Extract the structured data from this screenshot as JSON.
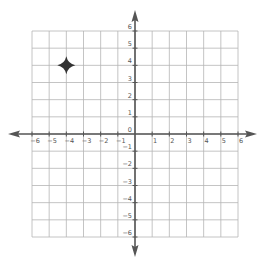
{
  "diagram": {
    "type": "coordinate-plane",
    "x_range": [
      -6,
      6
    ],
    "y_range": [
      -6,
      6
    ],
    "grid_step": 1,
    "x_tick_labels": [
      "-6",
      "-5",
      "-4",
      "-3",
      "-2",
      "-1",
      "1",
      "2",
      "3",
      "4",
      "5",
      "6"
    ],
    "y_tick_labels_positive": [
      "0",
      "1",
      "2",
      "3",
      "4",
      "5",
      "6"
    ],
    "y_tick_labels_negative": [
      "-1",
      "-2",
      "-3",
      "-4",
      "-5",
      "-6"
    ],
    "points": [
      {
        "x": -4,
        "y": 4,
        "marker": "four-point-star-icon"
      }
    ],
    "colors": {
      "grid": "#b5b5b5",
      "axis": "#555555",
      "marker": "#333333",
      "label": "#555555"
    }
  }
}
